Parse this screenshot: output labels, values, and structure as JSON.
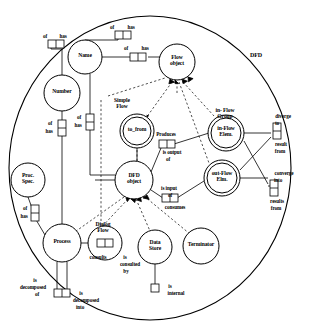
{
  "diagram": {
    "title": "DFD",
    "type": "conceptual-schema-orm",
    "universe_label": "DFD",
    "entities": [
      {
        "id": "name",
        "label": "Name",
        "cx": 85,
        "cy": 57,
        "r": 17,
        "double": false
      },
      {
        "id": "number",
        "label": "Number",
        "cx": 62,
        "cy": 93,
        "r": 18,
        "double": false
      },
      {
        "id": "flow_object",
        "label": "Flow\nobject",
        "cx": 177,
        "cy": 62,
        "r": 18,
        "double": false
      },
      {
        "id": "to_from",
        "label": "to_from",
        "cx": 137,
        "cy": 131,
        "r": 17,
        "double": true
      },
      {
        "id": "dfd_object",
        "label": "DFD\nobject",
        "cx": 134,
        "cy": 180,
        "r": 19,
        "double": false
      },
      {
        "id": "in_flow_elm",
        "label": "in-Flow\nElem.",
        "cx": 226,
        "cy": 133,
        "r": 18,
        "double": true
      },
      {
        "id": "out_flow_elm",
        "label": "out-Flow\nElm.",
        "cx": 222,
        "cy": 178,
        "r": 18,
        "double": true
      },
      {
        "id": "proc_spec",
        "label": "Proc.\nSpec.",
        "cx": 28,
        "cy": 180,
        "r": 17,
        "double": false
      },
      {
        "id": "process",
        "label": "Process",
        "cx": 62,
        "cy": 243,
        "r": 19,
        "double": false
      },
      {
        "id": "dialog_flow",
        "label": "",
        "cx": 105,
        "cy": 243,
        "r": 17,
        "double": false
      },
      {
        "id": "data_store",
        "label": "Data\nStore",
        "cx": 155,
        "cy": 247,
        "r": 17,
        "double": false
      },
      {
        "id": "terminator",
        "label": "Terminator",
        "cx": 201,
        "cy": 246,
        "r": 18,
        "double": false
      }
    ],
    "group_labels": [
      {
        "id": "simple_flow",
        "text": "Simple\nFlow",
        "x": 122,
        "y": 104
      },
      {
        "id": "in_flow_group",
        "text": "in- Flow\nGroup",
        "x": 225,
        "y": 114
      },
      {
        "id": "dialog_flow_label",
        "text": "Dialog\nFlow",
        "x": 103,
        "y": 228
      }
    ],
    "predicates": [
      {
        "id": "p-name-top",
        "roles": 2,
        "x": 123,
        "y": 35,
        "orient": "h",
        "labels": [
          {
            "t": "of",
            "x": 112,
            "y": 28
          },
          {
            "t": "has",
            "x": 131,
            "y": 28
          }
        ]
      },
      {
        "id": "p-number-top",
        "roles": 2,
        "x": 56,
        "y": 44,
        "orient": "h",
        "labels": [
          {
            "t": "of",
            "x": 45,
            "y": 37
          },
          {
            "t": "has",
            "x": 63,
            "y": 37
          }
        ]
      },
      {
        "id": "p-name-right",
        "roles": 2,
        "x": 138,
        "y": 57,
        "orient": "h",
        "labels": [
          {
            "t": "of",
            "x": 126,
            "y": 49
          },
          {
            "t": "has",
            "x": 145,
            "y": 49
          }
        ]
      },
      {
        "id": "p-number-vert",
        "roles": 2,
        "x": 62,
        "y": 128,
        "orient": "v",
        "labels": [
          {
            "t": "of",
            "x": 50,
            "y": 124
          },
          {
            "t": "has",
            "x": 49,
            "y": 132
          }
        ]
      },
      {
        "id": "p-name-vert",
        "roles": 2,
        "x": 90,
        "y": 122,
        "orient": "v",
        "labels": [
          {
            "t": "of",
            "x": 79,
            "y": 118
          },
          {
            "t": "has",
            "x": 78,
            "y": 126
          }
        ]
      },
      {
        "id": "p-produces",
        "roles": 2,
        "x": 167,
        "y": 144,
        "orient": "h",
        "labels": [
          {
            "t": "Produces",
            "x": 166,
            "y": 135
          },
          {
            "t": "is output",
            "x": 172,
            "y": 153
          },
          {
            "t": "of",
            "x": 168,
            "y": 160
          }
        ]
      },
      {
        "id": "p-isinput",
        "roles": 2,
        "x": 170,
        "y": 198,
        "orient": "h",
        "labels": [
          {
            "t": "is input",
            "x": 169,
            "y": 189
          },
          {
            "t": "of",
            "x": 170,
            "y": 196
          },
          {
            "t": "consumes",
            "x": 175,
            "y": 208
          }
        ]
      },
      {
        "id": "p-diverge",
        "roles": 2,
        "x": 277,
        "y": 131,
        "orient": "v",
        "labels": [
          {
            "t": "diverge",
            "x": 283,
            "y": 117
          },
          {
            "t": "to",
            "x": 277,
            "y": 124
          },
          {
            "t": "result",
            "x": 281,
            "y": 145
          },
          {
            "t": "from",
            "x": 280,
            "y": 152
          }
        ]
      },
      {
        "id": "p-converge",
        "roles": 2,
        "x": 274,
        "y": 188,
        "orient": "v",
        "labels": [
          {
            "t": "converge",
            "x": 284,
            "y": 174
          },
          {
            "t": "into",
            "x": 278,
            "y": 181
          },
          {
            "t": "results",
            "x": 277,
            "y": 202
          },
          {
            "t": "from",
            "x": 276,
            "y": 209
          }
        ]
      },
      {
        "id": "p-procspec",
        "roles": 2,
        "x": 35,
        "y": 213,
        "orient": "v",
        "labels": [
          {
            "t": "of",
            "x": 25,
            "y": 209
          },
          {
            "t": "has",
            "x": 24,
            "y": 217
          }
        ]
      },
      {
        "id": "p-dialog",
        "roles": 2,
        "x": 105,
        "y": 243,
        "orient": "h",
        "labels": [
          {
            "t": "consults",
            "x": 98,
            "y": 258
          },
          {
            "t": "is",
            "x": 125,
            "y": 258
          },
          {
            "t": "consulted",
            "x": 130,
            "y": 265
          },
          {
            "t": "by",
            "x": 126,
            "y": 272
          }
        ]
      },
      {
        "id": "p-internal",
        "roles": 1,
        "x": 155,
        "y": 288,
        "orient": "h",
        "labels": [
          {
            "t": "is",
            "x": 170,
            "y": 287
          },
          {
            "t": "internal",
            "x": 176,
            "y": 294
          }
        ]
      },
      {
        "id": "p-decomposed",
        "roles": 2,
        "x": 62,
        "y": 293,
        "orient": "h",
        "labels": [
          {
            "t": "is",
            "x": 35,
            "y": 281
          },
          {
            "t": "decomposed",
            "x": 33,
            "y": 288
          },
          {
            "t": "of",
            "x": 37,
            "y": 295
          },
          {
            "t": "is",
            "x": 81,
            "y": 294
          },
          {
            "t": "decomposed",
            "x": 86,
            "y": 301
          },
          {
            "t": "into",
            "x": 80,
            "y": 308
          }
        ]
      }
    ],
    "relationships": [
      {
        "from": "flow_object",
        "to": "to_from",
        "style": "dashed-subtype"
      },
      {
        "from": "flow_object",
        "to": "in_flow_elm",
        "style": "dashed-subtype"
      },
      {
        "from": "flow_object",
        "to": "out_flow_elm",
        "style": "dashed-subtype"
      },
      {
        "from": "dfd_object",
        "to": "process",
        "style": "dashed-subtype"
      },
      {
        "from": "dfd_object",
        "to": "data_store",
        "style": "dashed-subtype"
      },
      {
        "from": "dfd_object",
        "to": "terminator",
        "style": "dashed-subtype"
      },
      {
        "from": "dfd_object",
        "to": "flow_object",
        "style": "dashed-subtype"
      }
    ]
  }
}
